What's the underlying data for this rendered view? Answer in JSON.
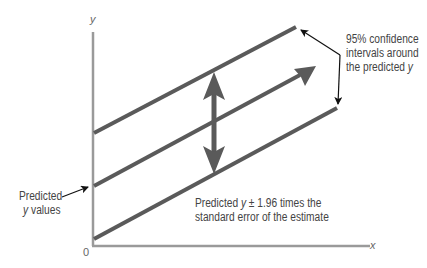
{
  "diagram": {
    "title": "",
    "axes": {
      "x_label": "x",
      "y_label": "y",
      "origin_label": "0"
    },
    "annotations": {
      "confidence": {
        "line1": "95% confidence",
        "line2": "intervals around",
        "line3_prefix": "the predicted ",
        "line3_var": "y"
      },
      "predicted_values": {
        "line1": "Predicted",
        "line2_var": "y",
        "line2_suffix": " values"
      },
      "band": {
        "line1_prefix": "Predicted ",
        "line1_var": "y",
        "line1_suffix": " ± 1.96 times the",
        "line2": "standard error of the estimate"
      }
    },
    "elements": [
      {
        "name": "upper-confidence-line",
        "type": "line"
      },
      {
        "name": "regression-line",
        "type": "arrow"
      },
      {
        "name": "lower-confidence-line",
        "type": "line"
      },
      {
        "name": "band-width-double-arrow",
        "type": "double-arrow"
      }
    ],
    "colors": {
      "line": "#5a5a5a",
      "axis": "#9a9a9a",
      "text": "#444444",
      "pointer": "#111111"
    }
  }
}
